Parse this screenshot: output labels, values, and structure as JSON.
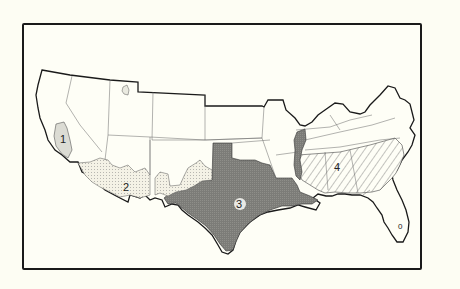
{
  "map": {
    "type": "choropleth-region-map",
    "extent": "Southern United States (California to Atlantic coast)",
    "background_color": "#fdfdf3",
    "frame_color": "#1a1a1a",
    "regions": [
      {
        "id": 1,
        "label": "1",
        "pattern": "light-gray-fill",
        "color": "#d9d9d2",
        "location": "Central California (San Joaquin Valley)"
      },
      {
        "id": 2,
        "label": "2",
        "pattern": "dotted",
        "color": "#f2f0e4",
        "location": "Southern Arizona / Southern New Mexico / West Texas"
      },
      {
        "id": 3,
        "label": "3",
        "pattern": "dark-gray-fill",
        "color": "#7a7a76",
        "location": "Texas, Oklahoma, Louisiana, Mississippi Valley"
      },
      {
        "id": 4,
        "label": "4",
        "pattern": "diagonal-hatch",
        "color": "#ffffff",
        "location": "Southeast (Mississippi, Alabama, Georgia, Carolinas)"
      }
    ],
    "extra_label": {
      "label": "0",
      "location": "Florida"
    }
  }
}
